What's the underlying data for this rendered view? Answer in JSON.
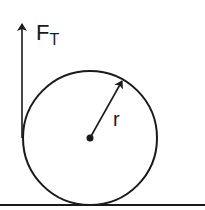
{
  "diagram": {
    "force_label": "F",
    "force_subscript": "T",
    "radius_label": "r",
    "stroke_color": "#1a1a1a",
    "background": "#ffffff"
  }
}
